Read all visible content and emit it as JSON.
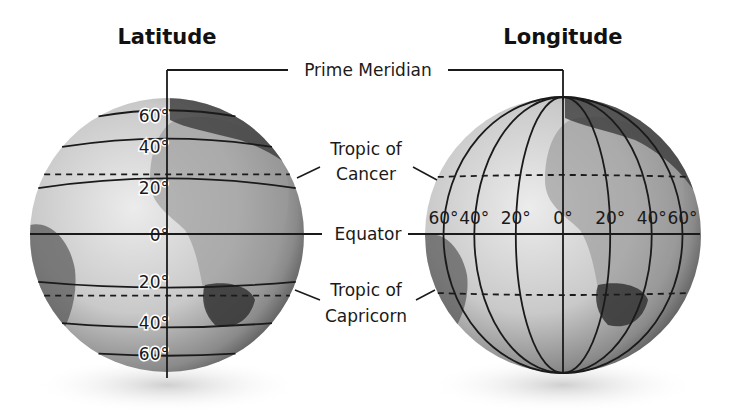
{
  "titles": {
    "latitude": "Latitude",
    "longitude": "Longitude"
  },
  "labels": {
    "prime_meridian": "Prime Meridian",
    "tropic_cancer_line1": "Tropic of",
    "tropic_cancer_line2": "Cancer",
    "equator": "Equator",
    "tropic_capricorn_line1": "Tropic of",
    "tropic_capricorn_line2": "Capricorn"
  },
  "latitude_globe": {
    "parallels": [
      {
        "label": "60°",
        "deg": 60
      },
      {
        "label": "40°",
        "deg": 40
      },
      {
        "label": "20°",
        "deg": 20
      },
      {
        "label": "0°",
        "deg": 0
      },
      {
        "label": "20°",
        "deg": -20
      },
      {
        "label": "40°",
        "deg": -40
      },
      {
        "label": "60°",
        "deg": -60
      }
    ],
    "tropics_deg": [
      23.5,
      -23.5
    ]
  },
  "longitude_globe": {
    "meridians": [
      {
        "label": "60°",
        "deg": -60
      },
      {
        "label": "40°",
        "deg": -40
      },
      {
        "label": "20°",
        "deg": -20
      },
      {
        "label": "0°",
        "deg": 0
      },
      {
        "label": "20°",
        "deg": 20
      },
      {
        "label": "40°",
        "deg": 40
      },
      {
        "label": "60°",
        "deg": 60
      }
    ],
    "tropics_deg": [
      23.5,
      -23.5
    ]
  },
  "colors": {
    "globe_light": "#e6e6e6",
    "globe_dark": "#3a3a3a",
    "ink": "#1a1a1a"
  }
}
